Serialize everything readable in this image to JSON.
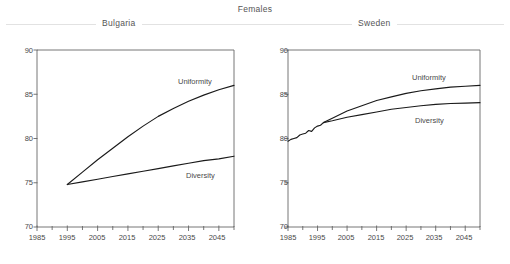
{
  "figure": {
    "main_title": "Females",
    "panels": [
      "Bulgaria",
      "Sweden"
    ]
  },
  "axis": {
    "y_ticks": [
      "70",
      "75",
      "80",
      "85",
      "90"
    ],
    "x_ticks": [
      "1985",
      "1995",
      "2005",
      "2015",
      "2025",
      "2035",
      "2045"
    ]
  },
  "series_labels": {
    "uniformity": "Uniformity",
    "diversity": "Diversity"
  },
  "colors": {
    "line": "#1a1a1a",
    "axis": "#666666",
    "text": "#4a4a4a",
    "rule": "#e2e2e2",
    "background": "#ffffff"
  },
  "chart_data": [
    {
      "type": "line",
      "title": "Bulgaria",
      "supertitle": "Females",
      "xlabel": "",
      "ylabel": "",
      "xlim": [
        1985,
        2050
      ],
      "ylim": [
        70,
        90
      ],
      "x_ticks": [
        1985,
        1995,
        2005,
        2015,
        2025,
        2035,
        2045
      ],
      "x_minor_tick_step": 5,
      "y_ticks": [
        70,
        75,
        80,
        85,
        90
      ],
      "grid": false,
      "legend": "inline-labels",
      "series": [
        {
          "name": "Uniformity",
          "x": [
            1995,
            2000,
            2005,
            2010,
            2015,
            2020,
            2025,
            2030,
            2035,
            2040,
            2045,
            2050
          ],
          "values": [
            74.8,
            76.2,
            77.6,
            78.9,
            80.2,
            81.4,
            82.5,
            83.4,
            84.2,
            84.9,
            85.5,
            86.0
          ],
          "label_at": {
            "x": 2028,
            "y": 87.3
          }
        },
        {
          "name": "Diversity",
          "x": [
            1995,
            2000,
            2005,
            2010,
            2015,
            2020,
            2025,
            2030,
            2035,
            2040,
            2045,
            2050
          ],
          "values": [
            74.8,
            75.1,
            75.4,
            75.7,
            76.0,
            76.3,
            76.6,
            76.9,
            77.2,
            77.5,
            77.7,
            78.0
          ],
          "label_at": {
            "x": 2032,
            "y": 75.9
          }
        }
      ]
    },
    {
      "type": "line",
      "title": "Sweden",
      "supertitle": "Females",
      "xlabel": "",
      "ylabel": "",
      "xlim": [
        1985,
        2050
      ],
      "ylim": [
        70,
        90
      ],
      "x_ticks": [
        1985,
        1995,
        2005,
        2015,
        2025,
        2035,
        2045
      ],
      "x_minor_tick_step": 5,
      "y_ticks": [
        70,
        75,
        80,
        85,
        90
      ],
      "grid": false,
      "legend": "inline-labels",
      "series": [
        {
          "name": "Observed",
          "x": [
            1985,
            1986,
            1987,
            1988,
            1989,
            1990,
            1991,
            1992,
            1993,
            1994,
            1995,
            1996,
            1997
          ],
          "values": [
            79.7,
            79.9,
            80.0,
            80.1,
            80.4,
            80.5,
            80.6,
            80.9,
            80.8,
            81.2,
            81.4,
            81.5,
            81.8
          ]
        },
        {
          "name": "Uniformity",
          "x": [
            1997,
            2000,
            2005,
            2010,
            2015,
            2020,
            2025,
            2030,
            2035,
            2040,
            2045,
            2050
          ],
          "values": [
            81.8,
            82.3,
            83.1,
            83.7,
            84.3,
            84.7,
            85.1,
            85.4,
            85.6,
            85.8,
            85.9,
            86.0
          ],
          "label_at": {
            "x": 2032,
            "y": 87.3
          }
        },
        {
          "name": "Diversity",
          "x": [
            1997,
            2000,
            2005,
            2010,
            2015,
            2020,
            2025,
            2030,
            2035,
            2040,
            2045,
            2050
          ],
          "values": [
            81.8,
            82.0,
            82.4,
            82.7,
            83.0,
            83.3,
            83.5,
            83.7,
            83.85,
            83.95,
            84.0,
            84.05
          ],
          "label_at": {
            "x": 2031,
            "y": 83.0
          }
        }
      ]
    }
  ]
}
